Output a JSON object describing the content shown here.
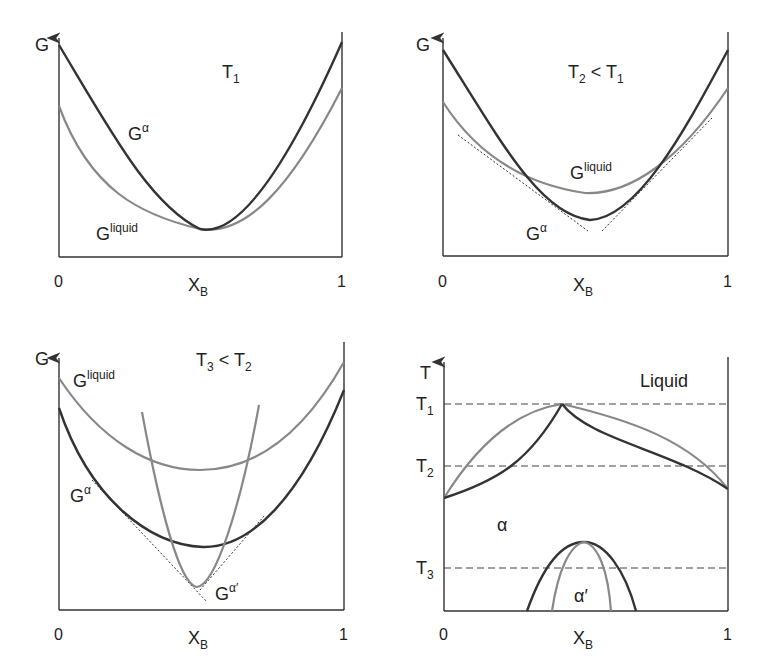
{
  "colors": {
    "alpha_curve": "#333333",
    "liquid_curve": "#888888",
    "axis": "#333333"
  },
  "panels": [
    {
      "id": "T1",
      "y_axis": "G",
      "x_axis": "X",
      "x_axis_sub": "B",
      "x_ticks": [
        "0",
        "1"
      ],
      "title_main": "T",
      "title_sub": "1",
      "title_rest": "",
      "labels": {
        "alpha": "G",
        "alpha_sup": "α",
        "liquid": "G",
        "liquid_sup": "liquid"
      }
    },
    {
      "id": "T2",
      "y_axis": "G",
      "x_axis": "X",
      "x_axis_sub": "B",
      "x_ticks": [
        "0",
        "1"
      ],
      "title_main": "T",
      "title_sub": "2",
      "title_rest": " < T",
      "title_sub2": "1",
      "labels": {
        "alpha": "G",
        "alpha_sup": "α",
        "liquid": "G",
        "liquid_sup": "liquid"
      }
    },
    {
      "id": "T3",
      "y_axis": "G",
      "x_axis": "X",
      "x_axis_sub": "B",
      "x_ticks": [
        "0",
        "1"
      ],
      "title_main": "T",
      "title_sub": "3",
      "title_rest": " < T",
      "title_sub2": "2",
      "labels": {
        "alpha": "G",
        "alpha_sup": "α",
        "liquid": "G",
        "liquid_sup": "liquid",
        "alpha_prime": "G",
        "alpha_prime_sup": "α′"
      }
    },
    {
      "id": "phase",
      "y_axis": "T",
      "x_axis": "X",
      "x_axis_sub": "B",
      "x_ticks": [
        "0",
        "1"
      ],
      "temps": [
        {
          "main": "T",
          "sub": "1"
        },
        {
          "main": "T",
          "sub": "2"
        },
        {
          "main": "T",
          "sub": "3"
        }
      ],
      "regions": {
        "liquid": "Liquid",
        "alpha": "α",
        "alpha_prime": "α′"
      }
    }
  ]
}
